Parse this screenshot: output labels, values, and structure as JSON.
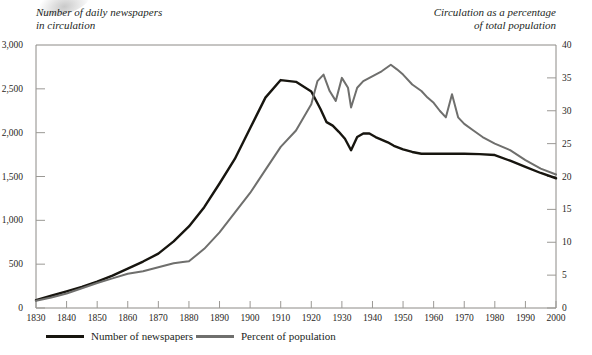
{
  "chart_data": {
    "type": "line",
    "title": "",
    "left_axis_title": "Number of daily newspapers\nin circulation",
    "right_axis_title": "Circulation as a percentage\nof total population",
    "xlabel": "",
    "xlim": [
      1830,
      2000
    ],
    "x_ticks": [
      1830,
      1840,
      1850,
      1860,
      1870,
      1880,
      1890,
      1900,
      1910,
      1920,
      1930,
      1940,
      1950,
      1960,
      1970,
      1980,
      1990,
      2000
    ],
    "left_ylim": [
      0,
      3000
    ],
    "left_y_ticks": [
      0,
      500,
      1000,
      1500,
      2000,
      2500,
      3000
    ],
    "left_y_tick_labels": [
      "0",
      "500",
      "1,000",
      "1,500",
      "2,000",
      "2,500",
      "3,000"
    ],
    "right_ylim": [
      0,
      40
    ],
    "right_y_ticks": [
      0,
      5,
      10,
      15,
      20,
      25,
      30,
      35,
      40
    ],
    "right_y_tick_labels": [
      "0",
      "5",
      "10",
      "15",
      "20",
      "25",
      "30",
      "35",
      "40"
    ],
    "grid": false,
    "legend_position": "bottom-left",
    "colors": {
      "newspapers": "#17150f",
      "percent": "#6f6f6d"
    },
    "series": [
      {
        "name": "Number of newspapers",
        "axis": "left",
        "color": "#17150f",
        "x": [
          1830,
          1835,
          1840,
          1845,
          1850,
          1855,
          1860,
          1865,
          1870,
          1875,
          1880,
          1885,
          1890,
          1895,
          1900,
          1905,
          1910,
          1915,
          1920,
          1923,
          1925,
          1927,
          1929,
          1931,
          1933,
          1935,
          1937,
          1939,
          1941,
          1945,
          1947,
          1950,
          1953,
          1956,
          1960,
          1963,
          1966,
          1970,
          1975,
          1980,
          1985,
          1990,
          1995,
          2000
        ],
        "values": [
          90,
          140,
          190,
          240,
          300,
          370,
          450,
          530,
          620,
          760,
          930,
          1150,
          1420,
          1700,
          2050,
          2400,
          2600,
          2580,
          2470,
          2270,
          2120,
          2080,
          2010,
          1930,
          1800,
          1950,
          1990,
          1990,
          1950,
          1890,
          1850,
          1810,
          1780,
          1760,
          1760,
          1760,
          1760,
          1760,
          1755,
          1745,
          1680,
          1610,
          1540,
          1480
        ]
      },
      {
        "name": "Percent of population",
        "axis": "right",
        "color": "#6f6f6d",
        "x": [
          1830,
          1835,
          1840,
          1845,
          1850,
          1855,
          1860,
          1865,
          1870,
          1875,
          1878,
          1880,
          1885,
          1890,
          1895,
          1900,
          1905,
          1910,
          1915,
          1920,
          1922,
          1924,
          1926,
          1928,
          1930,
          1932,
          1933,
          1935,
          1937,
          1939,
          1941,
          1943,
          1946,
          1948,
          1950,
          1953,
          1956,
          1958,
          1960,
          1962,
          1964,
          1966,
          1968,
          1970,
          1973,
          1976,
          1980,
          1985,
          1990,
          1995,
          2000
        ],
        "values": [
          1.1,
          1.6,
          2.2,
          3.0,
          3.8,
          4.5,
          5.2,
          5.6,
          6.2,
          6.8,
          7.0,
          7.1,
          9.0,
          11.5,
          14.5,
          17.5,
          21.0,
          24.5,
          27.0,
          31.0,
          34.5,
          35.5,
          33.0,
          31.5,
          35.0,
          33.5,
          30.5,
          33.5,
          34.5,
          35.0,
          35.5,
          36.0,
          37.0,
          36.3,
          35.5,
          34.0,
          33.0,
          32.0,
          31.2,
          30.0,
          29.0,
          32.5,
          29.0,
          28.0,
          27.0,
          26.0,
          25.0,
          24.0,
          22.5,
          21.2,
          20.3
        ]
      }
    ]
  }
}
